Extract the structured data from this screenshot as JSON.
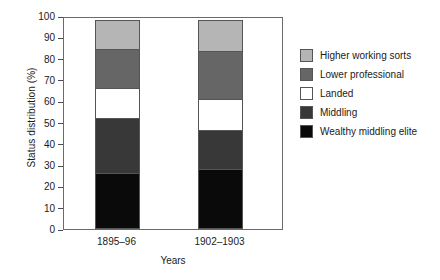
{
  "chart_data": {
    "type": "bar",
    "subtype": "stacked-bar-100",
    "title": "",
    "xlabel": "Years",
    "ylabel": "Status distribution (%)",
    "categories": [
      "1895–96",
      "1902–1903"
    ],
    "ylim": [
      0,
      100
    ],
    "yticks": [
      0,
      10,
      20,
      30,
      40,
      50,
      60,
      70,
      80,
      90,
      100
    ],
    "ytick_labels": [
      "0",
      "10",
      "20",
      "30",
      "40",
      "50",
      "60",
      "70",
      "80",
      "90",
      "100"
    ],
    "grid": false,
    "legend_position": "right",
    "stack_order_bottom_to_top": [
      "Wealthy middling elite",
      "Middling",
      "Landed",
      "Lower professional",
      "Higher working sorts"
    ],
    "series": [
      {
        "name": "Higher working sorts",
        "color": "#b5b5b5",
        "values": [
          14,
          15
        ]
      },
      {
        "name": "Lower professional",
        "color": "#666666",
        "values": [
          19,
          23
        ]
      },
      {
        "name": "Landed",
        "color": "#ffffff",
        "values": [
          14.5,
          15
        ]
      },
      {
        "name": "Middling",
        "color": "#383838",
        "values": [
          26,
          19
        ]
      },
      {
        "name": "Wealthy middling elite",
        "color": "#0a0a0a",
        "values": [
          26.5,
          28
        ]
      }
    ]
  },
  "axes": {
    "y_title": "Status distribution (%)",
    "x_title": "Years"
  },
  "legend": {
    "items": [
      {
        "label": "Higher working sorts",
        "color": "#b5b5b5"
      },
      {
        "label": "Lower professional",
        "color": "#666666"
      },
      {
        "label": "Landed",
        "color": "#ffffff"
      },
      {
        "label": "Middling",
        "color": "#383838"
      },
      {
        "label": "Wealthy middling elite",
        "color": "#0a0a0a"
      }
    ]
  }
}
